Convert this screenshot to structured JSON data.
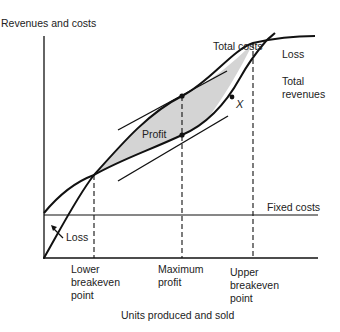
{
  "diagram": {
    "y_axis_label": "Revenues and costs",
    "x_axis_label": "Units produced and sold",
    "curves": {
      "total_costs": "Total costs",
      "total_revenues_line1": "Total",
      "total_revenues_line2": "revenues",
      "fixed_costs": "Fixed costs"
    },
    "regions": {
      "profit": "Profit",
      "loss_upper": "Loss",
      "loss_lower": "Loss"
    },
    "point_marker": "X",
    "x_markers": {
      "lower_breakeven": [
        "Lower",
        "breakeven",
        "point"
      ],
      "maximum_profit": [
        "Maximum",
        "profit"
      ],
      "upper_breakeven": [
        "Upper",
        "breakeven",
        "point"
      ]
    },
    "colors": {
      "line": "#111111",
      "profit_fill": "#d4d4d4",
      "background": "#ffffff"
    }
  }
}
